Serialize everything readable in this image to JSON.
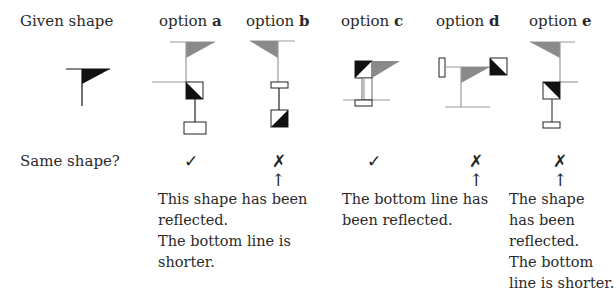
{
  "header": {
    "given_label": "Given shape",
    "options": [
      {
        "prefix": "option",
        "letter": "a"
      },
      {
        "prefix": "option",
        "letter": "b"
      },
      {
        "prefix": "option",
        "letter": "c"
      },
      {
        "prefix": "option",
        "letter": "d"
      },
      {
        "prefix": "option",
        "letter": "e"
      }
    ]
  },
  "question_label": "Same shape?",
  "answers": [
    {
      "option": "a",
      "mark": "✓",
      "correct": true
    },
    {
      "option": "b",
      "mark": "✗",
      "correct": false
    },
    {
      "option": "c",
      "mark": "✓",
      "correct": true
    },
    {
      "option": "d",
      "mark": "✗",
      "correct": false
    },
    {
      "option": "e",
      "mark": "✗",
      "correct": false
    }
  ],
  "arrow": "↑",
  "notes": {
    "b": [
      "This shape has been",
      "reflected.",
      "The bottom line is",
      "shorter."
    ],
    "d": [
      "The bottom line has",
      "been reflected."
    ],
    "e": [
      "The shape",
      "has been",
      "reflected.",
      "The bottom",
      "line is shorter."
    ]
  },
  "colors": {
    "black_fill": "#111111",
    "gray_fill": "#8a8a8a",
    "gray_line": "#9a9a9a",
    "text": "#2a2a2a"
  }
}
